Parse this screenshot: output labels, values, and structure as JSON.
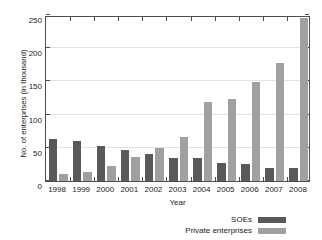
{
  "chart_data": {
    "type": "bar",
    "title": "",
    "xlabel": "Year",
    "ylabel": "No. of enterprises (in thousand)",
    "categories": [
      "1998",
      "1999",
      "2000",
      "2001",
      "2002",
      "2003",
      "2004",
      "2005",
      "2006",
      "2007",
      "2008"
    ],
    "series": [
      {
        "name": "SOEs",
        "color": "#595959",
        "values": [
          64,
          60,
          53,
          46,
          41,
          34,
          35,
          27,
          25,
          20,
          20
        ]
      },
      {
        "name": "Private enterprises",
        "color": "#a0a0a0",
        "values": [
          11,
          14,
          22,
          36,
          49,
          67,
          119,
          123,
          149,
          177,
          245
        ]
      }
    ],
    "ylim": [
      0,
      250
    ],
    "yticks": [
      0,
      50,
      100,
      150,
      200,
      250
    ],
    "ytick_labels": [
      "0",
      "50",
      "100",
      "150",
      "200",
      "250"
    ],
    "grid": true,
    "legend_position": "bottom-right"
  }
}
